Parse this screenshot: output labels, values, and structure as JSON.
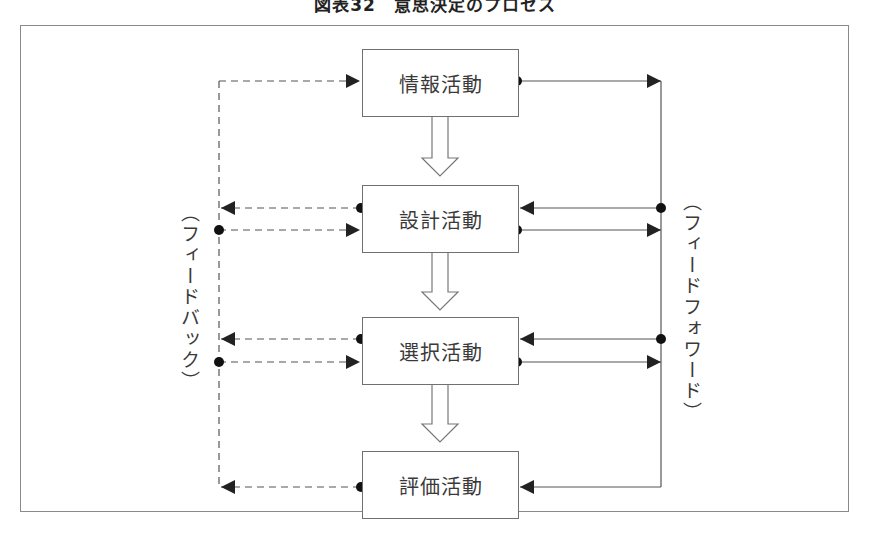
{
  "figure": {
    "title": "図表32　意思決定のプロセス"
  },
  "boxes": [
    {
      "id": "info",
      "label": "情報活動"
    },
    {
      "id": "design",
      "label": "設計活動"
    },
    {
      "id": "choice",
      "label": "選択活動"
    },
    {
      "id": "review",
      "label": "評価活動"
    }
  ],
  "side_labels": {
    "feedback": "（フィードバック）",
    "feedforward": "（フィードフォワード）"
  },
  "legend_semantics": {
    "dashed_line": "feedback",
    "solid_line": "feedforward",
    "hollow_arrow": "sequence"
  },
  "colors": {
    "line": "#555555",
    "border": "#707070",
    "frame": "#8a8a8a",
    "text": "#3a3a3a"
  }
}
